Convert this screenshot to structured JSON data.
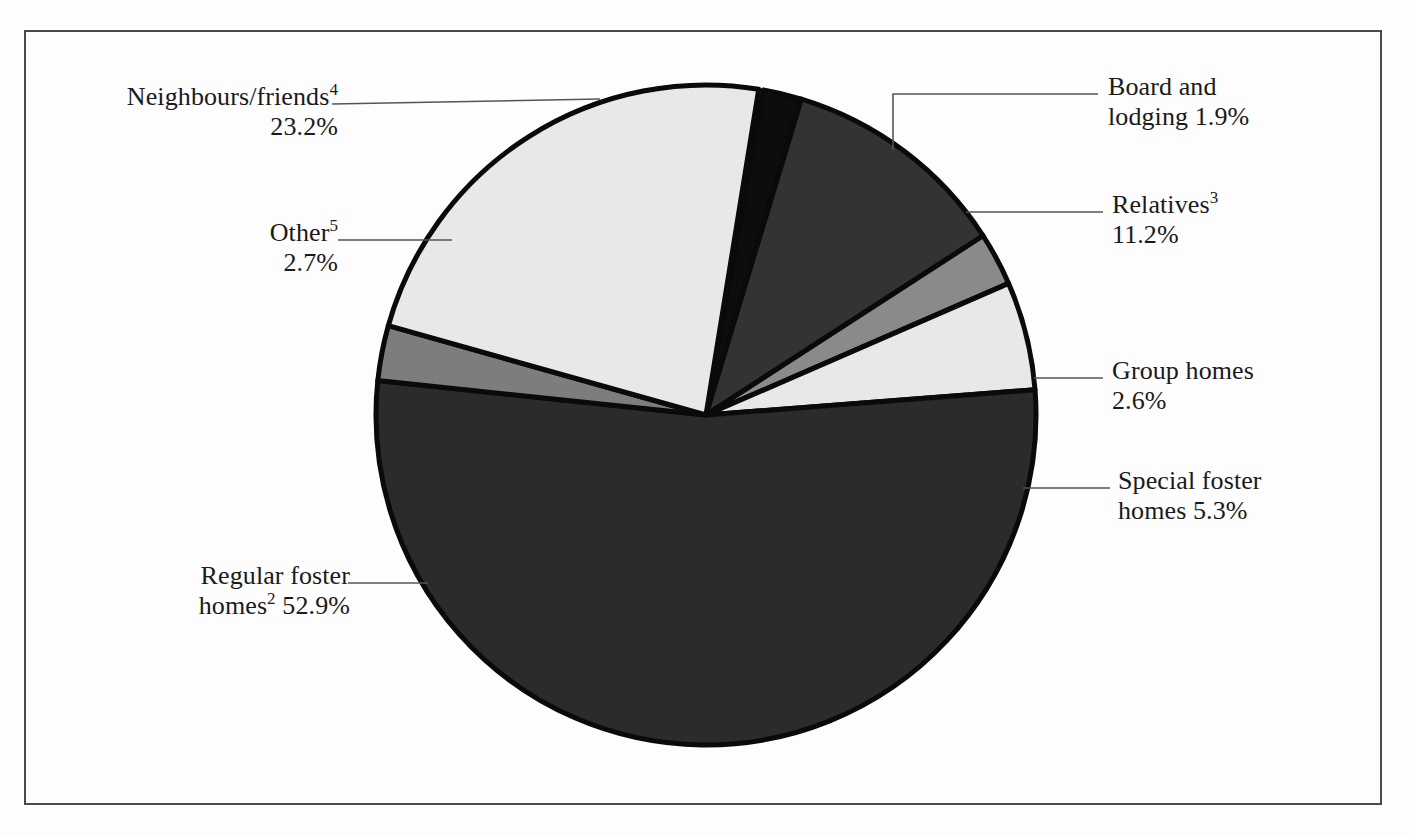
{
  "figure": {
    "kind": "pie-chart",
    "background": "#fdfdfd",
    "frame_color": "#4a4a4a"
  },
  "labels": {
    "neighbours": {
      "name": "Neighbours/friends",
      "sup": "4",
      "value": "23.2%"
    },
    "other": {
      "name": "Other",
      "sup": "5",
      "value": "2.7%"
    },
    "regular": {
      "name_line1": "Regular foster",
      "name_line2": "homes",
      "sup": "2",
      "value": "52.9%"
    },
    "board": {
      "name_line1": "Board and",
      "name_line2": "lodging",
      "value": "1.9%"
    },
    "relatives": {
      "name": "Relatives",
      "sup": "3",
      "value": "11.2%"
    },
    "group": {
      "name": "Group homes",
      "value": "2.6%"
    },
    "special": {
      "name_line1": "Special foster",
      "name_line2": "homes",
      "value": "5.3%"
    }
  },
  "chart_data": {
    "type": "pie",
    "title": "",
    "xlabel": "",
    "ylabel": "",
    "legend_position": "callout-labels",
    "grid": false,
    "units": "percent",
    "total": 99.8,
    "center": {
      "x": 706,
      "y": 415
    },
    "radius": 330,
    "start_angle_deg": -80,
    "direction": "clockwise",
    "slices": [
      {
        "label": "Board and lodging",
        "footnote": "",
        "value": 1.9,
        "color": "#0d0d0d",
        "start_deg": -80.0,
        "end_deg": -73.2
      },
      {
        "label": "Relatives",
        "footnote": "3",
        "value": 11.2,
        "color": "#333333",
        "start_deg": -73.2,
        "end_deg": -32.9
      },
      {
        "label": "Group homes",
        "footnote": "",
        "value": 2.6,
        "color": "#8a8a8a",
        "start_deg": -32.9,
        "end_deg": -23.5
      },
      {
        "label": "Special foster homes",
        "footnote": "",
        "value": 5.3,
        "color": "#e8e8e6",
        "start_deg": -23.5,
        "end_deg": -4.4
      },
      {
        "label": "Regular foster homes",
        "footnote": "2",
        "value": 52.9,
        "color": "#2b2b2b",
        "start_deg": -4.4,
        "end_deg": 186.0
      },
      {
        "label": "Other",
        "footnote": "5",
        "value": 2.7,
        "color": "#7d7d7d",
        "start_deg": 186.0,
        "end_deg": 195.7
      },
      {
        "label": "Neighbours/friends",
        "footnote": "4",
        "value": 23.2,
        "color": "#e8e8e6",
        "start_deg": 195.7,
        "end_deg": 279.2
      }
    ],
    "callouts": [
      {
        "label": "Neighbours/friends",
        "kind": "line",
        "points": "332,104 600,99"
      },
      {
        "label": "Other",
        "kind": "line",
        "points": "338,240 452,240"
      },
      {
        "label": "Regular foster homes",
        "kind": "line",
        "points": "348,583 428,583"
      },
      {
        "label": "Board and lodging",
        "kind": "elbow",
        "points": "893,150 893,94 1098,94"
      },
      {
        "label": "Relatives",
        "kind": "line",
        "points": "966,212 1103,212"
      },
      {
        "label": "Group homes",
        "kind": "line",
        "points": "1034,378 1103,378"
      },
      {
        "label": "Special foster homes",
        "kind": "line",
        "points": "1023,488 1110,488"
      }
    ]
  }
}
